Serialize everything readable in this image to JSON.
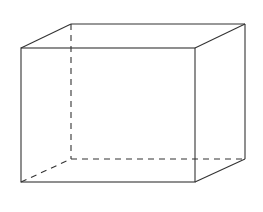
{
  "diagram": {
    "type": "cuboid",
    "stroke_color": "#333333",
    "background": "#ffffff",
    "front_face": {
      "top_left": [
        21,
        48
      ],
      "top_right": [
        195,
        48
      ],
      "bottom_right": [
        195,
        182
      ],
      "bottom_left": [
        21,
        182
      ]
    },
    "back_face": {
      "top_left": [
        71,
        24
      ],
      "top_right": [
        245,
        24
      ],
      "bottom_right": [
        245,
        159
      ],
      "bottom_left": [
        71,
        159
      ]
    },
    "hidden_edges": [
      "back-left-vertical",
      "back-bottom",
      "bottom-left-depth"
    ]
  }
}
